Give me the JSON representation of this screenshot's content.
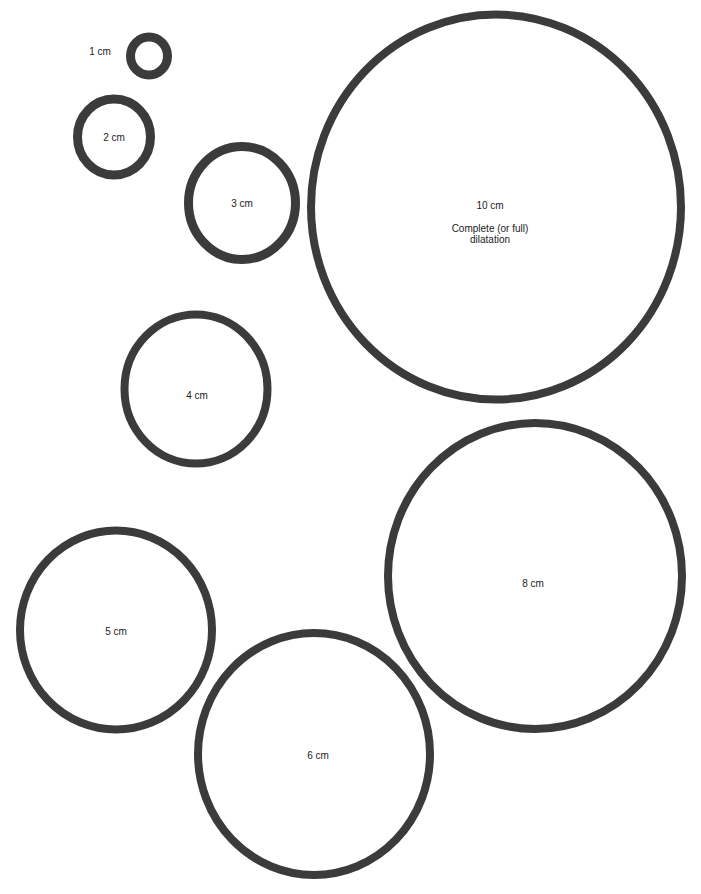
{
  "diagram": {
    "stroke_color": "#3b3b3b",
    "background_color": "#ffffff",
    "circles": [
      {
        "id": "1cm",
        "label": "1 cm",
        "cx": 149,
        "cy": 56,
        "rx": 23,
        "ry": 23.5,
        "stroke": 9,
        "label_x": 100,
        "label_y": 51
      },
      {
        "id": "2cm",
        "label": "2 cm",
        "cx": 114,
        "cy": 137,
        "rx": 41,
        "ry": 42.5,
        "stroke": 9,
        "label_x": 114,
        "label_y": 137
      },
      {
        "id": "3cm",
        "label": "3 cm",
        "cx": 242,
        "cy": 203,
        "rx": 58,
        "ry": 61,
        "stroke": 9,
        "label_x": 242,
        "label_y": 203
      },
      {
        "id": "10cm",
        "label": "10 cm",
        "sublabel": "Complete (or full)\ndilatation",
        "cx": 496,
        "cy": 207,
        "rx": 189,
        "ry": 196.5,
        "stroke": 8,
        "label_x": 490,
        "label_y": 222
      },
      {
        "id": "4cm",
        "label": "4 cm",
        "cx": 196,
        "cy": 389,
        "rx": 75.5,
        "ry": 78.5,
        "stroke": 8,
        "label_x": 197,
        "label_y": 395
      },
      {
        "id": "8cm",
        "label": "8 cm",
        "cx": 535,
        "cy": 576,
        "rx": 151,
        "ry": 157,
        "stroke": 8,
        "label_x": 533,
        "label_y": 583
      },
      {
        "id": "5cm",
        "label": "5 cm",
        "cx": 116,
        "cy": 630,
        "rx": 100,
        "ry": 103.5,
        "stroke": 8,
        "label_x": 116,
        "label_y": 631
      },
      {
        "id": "6cm",
        "label": "6 cm",
        "cx": 314,
        "cy": 754,
        "rx": 120,
        "ry": 125,
        "stroke": 8,
        "label_x": 318,
        "label_y": 755
      }
    ]
  }
}
